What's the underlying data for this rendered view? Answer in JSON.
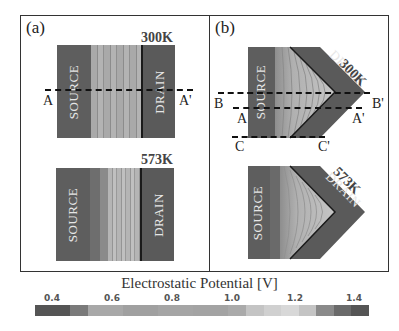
{
  "panels": [
    {
      "label": "(a)",
      "top_temp": "300K",
      "bottom_temp": "573K",
      "source_label": "SOURCE",
      "drain_label": "DRAIN",
      "cuts": [
        {
          "left": "A",
          "right": "A'"
        }
      ]
    },
    {
      "label": "(b)",
      "top_temp": "300K",
      "bottom_temp": "573K",
      "source_label": "SOURCE",
      "drain_label": "DRAIN",
      "cuts": [
        {
          "left": "B",
          "right": "B'"
        },
        {
          "left": "A",
          "right": "A'"
        },
        {
          "left": "C",
          "right": "C'"
        }
      ]
    }
  ],
  "colorbar": {
    "title": "Electrostatic Potential [V]",
    "ticks": [
      "0.4",
      "0.6",
      "0.8",
      "1.0",
      "1.2",
      "1.4"
    ],
    "colors": [
      "#555555",
      "#555555",
      "#7a7a7a",
      "#a8a8a8",
      "#a8a8a8",
      "#a0a0a0",
      "#a0a0a0",
      "#a5a5a5",
      "#a5a5a5",
      "#a3a3a3",
      "#a3a3a3",
      "#aaaaaa",
      "#c4c4c4",
      "#d0d0d0",
      "#d8d8d8",
      "#c4c4c4",
      "#8a8a8a",
      "#6a6a6a",
      "#555555"
    ]
  },
  "palette": {
    "source": "#5e5e5e",
    "drain": "#5a5a5a",
    "channel_light": "#b0b0b0",
    "channel_mid": "#9a9a9a",
    "dark": "#4a4a4a"
  }
}
